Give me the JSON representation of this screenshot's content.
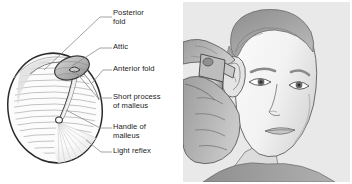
{
  "figure": {
    "panels": [
      "eardrum-diagram",
      "otoscopy-illustration"
    ]
  },
  "colors": {
    "background": "#ffffff",
    "text": "#1c1c1c",
    "leader_line": "#8a8a8a",
    "drum_outline": "#2b2b2b",
    "drum_fill": "#fbfbfb",
    "striation": "#a8a8a8",
    "attic_fill": "#b4b4b4",
    "photo_background": "#e9e9e9",
    "skin_light": "#efefef",
    "skin_mid": "#cfcfcf",
    "skin_shadow": "#a9a9a9",
    "hair": "#9a9a9a",
    "hair_dark": "#7b7b7b",
    "otoscope_body": "#d8d8d8",
    "otoscope_shadow": "#9e9e9e",
    "outline": "#4a4a4a"
  },
  "diagram": {
    "name": "right tympanic membrane",
    "labels": [
      {
        "id": "posterior-fold",
        "line1": "Posterior",
        "line2": "fold"
      },
      {
        "id": "attic",
        "line1": "Attic",
        "line2": ""
      },
      {
        "id": "anterior-fold",
        "line1": "Anterior fold",
        "line2": ""
      },
      {
        "id": "short-process-of-malleus",
        "line1": "Short process",
        "line2": "of malleus"
      },
      {
        "id": "handle-of-malleus",
        "line1": "Handle of",
        "line2": "malleus"
      },
      {
        "id": "light-reflex",
        "line1": "Light reflex",
        "line2": ""
      }
    ]
  },
  "photo": {
    "description": "Clinician holding an otoscope to the ear of a young patient",
    "subject": "patient head, three-quarter view",
    "instrument": "otoscope"
  }
}
